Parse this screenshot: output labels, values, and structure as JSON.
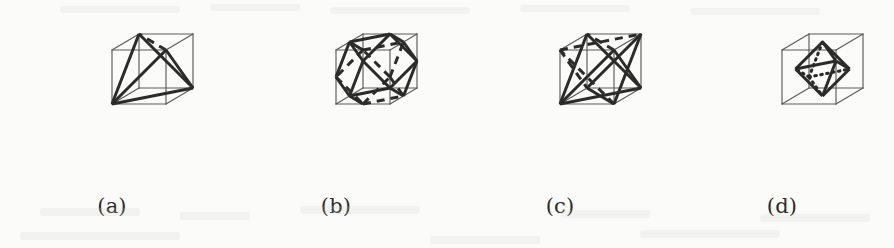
{
  "figure": {
    "background_color": "#fbfbf9",
    "ink_color": "#2b2b2b",
    "cube_color": "#5a5a5a",
    "panel_width": 224,
    "panel_height": 248
  },
  "projection": {
    "description": "oblique axonometric, unit cube corners projected to panel pixels",
    "origin_x": 112,
    "origin_y": 104,
    "axis_x": [
      54,
      0
    ],
    "axis_y": [
      0,
      -54
    ],
    "axis_z": [
      27,
      -16
    ]
  },
  "panels": [
    {
      "id": "a",
      "label": "(a)",
      "name": "tetrahedron-in-cube",
      "solid": "tetrahedron",
      "vertices": [
        [
          0,
          0,
          0
        ],
        [
          1,
          1,
          0
        ],
        [
          1,
          0,
          1
        ],
        [
          0,
          1,
          1
        ]
      ],
      "solid_edges": [
        [
          0,
          1
        ],
        [
          0,
          2
        ],
        [
          0,
          3
        ],
        [
          1,
          2
        ],
        [
          2,
          3
        ],
        [
          1,
          3
        ]
      ],
      "hidden_edges": [
        [
          1,
          3
        ]
      ],
      "hidden_style": "dashed"
    },
    {
      "id": "b",
      "label": "(b)",
      "name": "cuboctahedron-in-cube",
      "solid": "cuboctahedron",
      "vertices": [
        [
          0.5,
          0,
          0
        ],
        [
          1,
          0.5,
          0
        ],
        [
          0.5,
          1,
          0
        ],
        [
          0,
          0.5,
          0
        ],
        [
          0.5,
          0,
          1
        ],
        [
          1,
          0.5,
          1
        ],
        [
          0.5,
          1,
          1
        ],
        [
          0,
          0.5,
          1
        ],
        [
          0,
          0,
          0.5
        ],
        [
          1,
          0,
          0.5
        ],
        [
          1,
          1,
          0.5
        ],
        [
          0,
          1,
          0.5
        ]
      ],
      "solid_edges": [
        [
          0,
          1
        ],
        [
          1,
          2
        ],
        [
          2,
          3
        ],
        [
          3,
          0
        ],
        [
          4,
          5
        ],
        [
          5,
          6
        ],
        [
          6,
          7
        ],
        [
          7,
          4
        ],
        [
          0,
          8
        ],
        [
          0,
          9
        ],
        [
          1,
          9
        ],
        [
          1,
          10
        ],
        [
          2,
          10
        ],
        [
          2,
          11
        ],
        [
          3,
          11
        ],
        [
          3,
          8
        ],
        [
          4,
          8
        ],
        [
          4,
          9
        ],
        [
          5,
          9
        ],
        [
          5,
          10
        ],
        [
          6,
          10
        ],
        [
          6,
          11
        ],
        [
          7,
          11
        ],
        [
          7,
          8
        ]
      ],
      "hidden_edges": [
        [
          0,
          1
        ],
        [
          1,
          2
        ],
        [
          2,
          3
        ],
        [
          3,
          0
        ],
        [
          0,
          9
        ],
        [
          1,
          9
        ],
        [
          1,
          10
        ],
        [
          2,
          10
        ]
      ],
      "hidden_style": "dashed"
    },
    {
      "id": "c",
      "label": "(c)",
      "name": "stella-octangula-in-cube",
      "solid": "stella-octangula",
      "vertices": [
        [
          0,
          0,
          0
        ],
        [
          1,
          1,
          0
        ],
        [
          1,
          0,
          1
        ],
        [
          0,
          1,
          1
        ],
        [
          1,
          0,
          0
        ],
        [
          0,
          1,
          0
        ],
        [
          0,
          0,
          1
        ],
        [
          1,
          1,
          1
        ]
      ],
      "solid_edges": [
        [
          0,
          1
        ],
        [
          0,
          2
        ],
        [
          0,
          3
        ],
        [
          1,
          2
        ],
        [
          2,
          3
        ],
        [
          1,
          3
        ],
        [
          4,
          5
        ],
        [
          4,
          6
        ],
        [
          4,
          7
        ],
        [
          5,
          6
        ],
        [
          6,
          7
        ],
        [
          5,
          7
        ]
      ],
      "hidden_edges": [
        [
          1,
          3
        ],
        [
          4,
          5
        ],
        [
          5,
          6
        ],
        [
          5,
          7
        ]
      ],
      "hidden_style": "dashed"
    },
    {
      "id": "d",
      "label": "(d)",
      "name": "octahedron-in-cube",
      "solid": "octahedron",
      "vertices": [
        [
          0.5,
          0.5,
          0
        ],
        [
          0.5,
          0.5,
          1
        ],
        [
          0.5,
          0,
          0.5
        ],
        [
          0.5,
          1,
          0.5
        ],
        [
          0,
          0.5,
          0.5
        ],
        [
          1,
          0.5,
          0.5
        ]
      ],
      "solid_edges": [
        [
          0,
          2
        ],
        [
          0,
          3
        ],
        [
          0,
          4
        ],
        [
          0,
          5
        ],
        [
          1,
          2
        ],
        [
          1,
          3
        ],
        [
          1,
          4
        ],
        [
          1,
          5
        ],
        [
          2,
          4
        ],
        [
          4,
          3
        ],
        [
          3,
          5
        ],
        [
          5,
          2
        ]
      ],
      "hidden_edges": [
        [
          0,
          2
        ],
        [
          0,
          3
        ],
        [
          0,
          4
        ],
        [
          0,
          5
        ]
      ],
      "hidden_style": "dotted"
    }
  ],
  "cube_edges": [
    [
      0,
      1
    ],
    [
      1,
      2
    ],
    [
      2,
      3
    ],
    [
      3,
      0
    ],
    [
      4,
      5
    ],
    [
      5,
      6
    ],
    [
      6,
      7
    ],
    [
      7,
      4
    ],
    [
      0,
      4
    ],
    [
      1,
      5
    ],
    [
      2,
      6
    ],
    [
      3,
      7
    ]
  ],
  "cube_vertices": [
    [
      0,
      0,
      0
    ],
    [
      1,
      0,
      0
    ],
    [
      1,
      1,
      0
    ],
    [
      0,
      1,
      0
    ],
    [
      0,
      0,
      1
    ],
    [
      1,
      0,
      1
    ],
    [
      1,
      1,
      1
    ],
    [
      0,
      1,
      1
    ]
  ]
}
